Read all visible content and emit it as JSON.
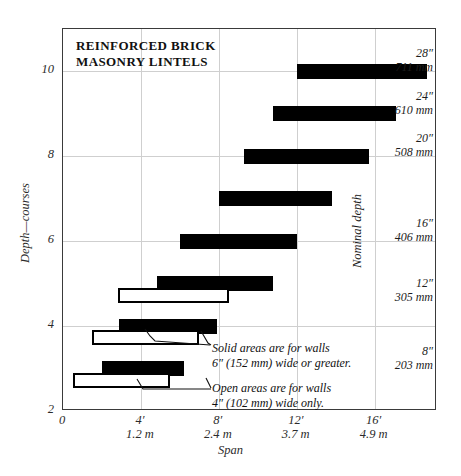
{
  "chart_data": {
    "type": "bar",
    "orientation": "horizontal",
    "title": "REINFORCED BRICK\nMASONRY LINTELS",
    "xlabel": "Span",
    "ylabel": "Depth—courses",
    "y2label": "Nominal depth",
    "xlim": [
      0,
      19.2
    ],
    "ylim": [
      2,
      11
    ],
    "grid": true,
    "legend": null,
    "xticks": [
      {
        "value": 0,
        "feet": "0",
        "meters": ""
      },
      {
        "value": 4,
        "feet": "4′",
        "meters": "1.2 m"
      },
      {
        "value": 8,
        "feet": "8′",
        "meters": "2.4 m"
      },
      {
        "value": 12,
        "feet": "12′",
        "meters": "3.7 m"
      },
      {
        "value": 16,
        "feet": "16′",
        "meters": "4.9 m"
      }
    ],
    "yticks": [
      {
        "value": 2,
        "label": "2"
      },
      {
        "value": 4,
        "label": "4"
      },
      {
        "value": 6,
        "label": "6"
      },
      {
        "value": 8,
        "label": "8"
      },
      {
        "value": 10,
        "label": "10"
      }
    ],
    "depth_labels": [
      {
        "courses": 10,
        "inches": "28″",
        "mm": "711 mm"
      },
      {
        "courses": 9,
        "inches": "24″",
        "mm": "610 mm"
      },
      {
        "courses": 8,
        "inches": "20″",
        "mm": "508 mm"
      },
      {
        "courses": 6,
        "inches": "16″",
        "mm": "406 mm"
      },
      {
        "courses": 4.6,
        "inches": "12″",
        "mm": "305 mm"
      },
      {
        "courses": 3,
        "inches": "8″",
        "mm": "203 mm"
      }
    ],
    "series": [
      {
        "name": "Solid areas are for walls 6″ (152 mm) wide or greater.",
        "style": "solid",
        "bars": [
          {
            "courses": 10,
            "start": 12.0,
            "end": 18.7
          },
          {
            "courses": 9,
            "start": 10.8,
            "end": 17.1
          },
          {
            "courses": 8,
            "start": 9.3,
            "end": 15.7
          },
          {
            "courses": 7,
            "start": 8.0,
            "end": 13.8
          },
          {
            "courses": 6,
            "start": 6.0,
            "end": 12.0
          },
          {
            "courses": 5,
            "start": 4.8,
            "end": 10.8
          },
          {
            "courses": 4,
            "start": 2.9,
            "end": 7.9
          },
          {
            "courses": 3,
            "start": 2.0,
            "end": 6.2
          }
        ]
      },
      {
        "name": "Open areas are for walls 4″ (102 mm) wide only.",
        "style": "open",
        "bars": [
          {
            "courses": 4.72,
            "start": 2.8,
            "end": 8.5
          },
          {
            "courses": 3.72,
            "start": 1.5,
            "end": 7.0
          },
          {
            "courses": 2.72,
            "start": 0.5,
            "end": 5.5
          }
        ]
      }
    ],
    "annotations": [
      {
        "id": "solid-note",
        "text": "Solid areas are for walls\n6″ (152 mm) wide or greater."
      },
      {
        "id": "open-note",
        "text": "Open areas are for walls\n4″ (102 mm) wide only."
      }
    ]
  },
  "colors": {
    "bar_solid": "#000000",
    "bar_open_fill": "#ffffff",
    "bar_open_stroke": "#000000",
    "grid": "#cfcfcf",
    "frame": "#3a3a3a",
    "text": "#111111"
  }
}
